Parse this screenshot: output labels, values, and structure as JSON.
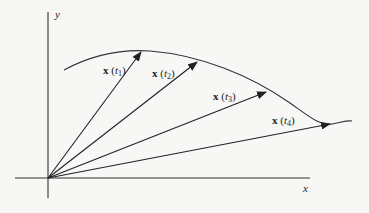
{
  "diagram": {
    "axes": {
      "x_label": "x",
      "y_label": "y"
    },
    "vectors": [
      {
        "name": "x",
        "param": "t",
        "sub": "1",
        "tip": [
          141,
          52
        ]
      },
      {
        "name": "x",
        "param": "t",
        "sub": "2",
        "tip": [
          197,
          62
        ]
      },
      {
        "name": "x",
        "param": "t",
        "sub": "3",
        "tip": [
          266,
          92
        ]
      },
      {
        "name": "x",
        "param": "t",
        "sub": "4",
        "tip": [
          330,
          124
        ]
      }
    ],
    "colors": {
      "background": "#f7f7f5",
      "ink": "#222222"
    }
  }
}
